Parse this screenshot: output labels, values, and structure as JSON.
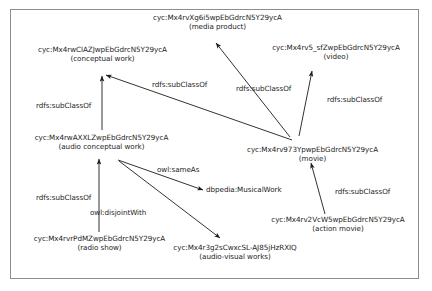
{
  "diagram": {
    "background_color": "#ffffff",
    "border_color": "#8d8d8d",
    "text_color": "#1c1c1c",
    "nodes": [
      {
        "id": "media-product",
        "uri": "cyc:Mx4rvXg6i5wpEbGdrcN5Y29ycA",
        "gloss": "(media product)"
      },
      {
        "id": "conceptual-work",
        "uri": "cyc:Mx4rwClAZJwpEbGdrcN5Y29ycA",
        "gloss": "(conceptual work)"
      },
      {
        "id": "video",
        "uri": "cyc:Mx4rv5_sfZwpEbGdrcN5Y29ycA",
        "gloss": "(video)"
      },
      {
        "id": "audio-conceptual-work",
        "uri": "cyc:Mx4rwAXXLZwpEbGdrcN5Y29ycA",
        "gloss": "(audio conceptual work)"
      },
      {
        "id": "movie",
        "uri": "cyc:Mx4rv973YpwpEbGdrcN5Y29ycA",
        "gloss": "(movie)"
      },
      {
        "id": "musical-work",
        "uri": "dbpedia:MusicalWork",
        "gloss": ""
      },
      {
        "id": "radio-show",
        "uri": "cyc:Mx4rvrPdMZwpEbGdrcN5Y29ycA",
        "gloss": "(radio show)"
      },
      {
        "id": "audio-visual-works",
        "uri": "cyc:Mx4r3g2sCwxcSL-AJ85jHzRXIQ",
        "gloss": "(audio-visual works)"
      },
      {
        "id": "action-movie",
        "uri": "cyc:Mx4rv2VcW5wpEbGdrcN5Y29ycA",
        "gloss": "(action movie)"
      }
    ],
    "edges": [
      {
        "id": "movie-subclassof-conceptual-work",
        "label": "rdfs:subClassOf",
        "source": "movie",
        "target": "conceptual-work"
      },
      {
        "id": "movie-subclassof-media-product",
        "label": "rdfs:subClassOf",
        "source": "movie",
        "target": "media-product"
      },
      {
        "id": "video-subclassof-movie",
        "label": "rdfs:subClassOf",
        "source": "movie",
        "target": "video"
      },
      {
        "id": "audio-conceptual-subclassof-conceptual-work",
        "label": "rdfs:subClassOf",
        "source": "audio-conceptual-work",
        "target": "conceptual-work"
      },
      {
        "id": "radio-show-subclassof-audio-conceptual",
        "label": "rdfs:subClassOf",
        "source": "radio-show",
        "target": "audio-conceptual-work"
      },
      {
        "id": "audio-conceptual-sameas-musical-work",
        "label": "owl:sameAs",
        "source": "audio-conceptual-work",
        "target": "musical-work"
      },
      {
        "id": "audio-conceptual-disjointwith-audio-visual",
        "label": "owl:disjointWith",
        "source": "audio-conceptual-work",
        "target": "audio-visual-works"
      },
      {
        "id": "action-movie-subclassof-movie",
        "label": "rdfs:subClassOf",
        "source": "action-movie",
        "target": "movie"
      }
    ]
  }
}
